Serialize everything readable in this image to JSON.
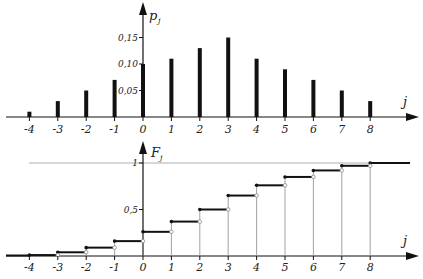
{
  "chart_data": [
    {
      "type": "bar",
      "title": "",
      "ylabel": "p_j",
      "xlabel": "j",
      "categories": [
        -4,
        -3,
        -2,
        -1,
        0,
        1,
        2,
        3,
        4,
        5,
        6,
        7,
        8
      ],
      "values": [
        0.01,
        0.03,
        0.05,
        0.07,
        0.1,
        0.11,
        0.13,
        0.15,
        0.11,
        0.09,
        0.07,
        0.05,
        0.03
      ],
      "yticks": [
        0.05,
        0.1,
        0.15
      ],
      "ytick_labels": [
        "0,05",
        "0,10",
        "0,15"
      ],
      "ylim": [
        0,
        0.2
      ],
      "grid": false
    },
    {
      "type": "line",
      "subtype": "step",
      "title": "",
      "ylabel": "F_j",
      "xlabel": "j",
      "x": [
        -4,
        -3,
        -2,
        -1,
        0,
        1,
        2,
        3,
        4,
        5,
        6,
        7,
        8
      ],
      "values": [
        0.01,
        0.04,
        0.09,
        0.16,
        0.26,
        0.37,
        0.5,
        0.65,
        0.76,
        0.85,
        0.92,
        0.97,
        1.0
      ],
      "yticks": [
        0.5,
        1
      ],
      "ytick_labels": [
        "0,5",
        "1"
      ],
      "reference_line": 1,
      "ylim": [
        0,
        1.2
      ],
      "grid": false
    }
  ],
  "top_panel": {
    "y_axis_label": "p",
    "y_axis_sub": "j",
    "x_axis_label": "j"
  },
  "bottom_panel": {
    "y_axis_label": "F",
    "y_axis_sub": "j",
    "x_axis_label": "j"
  },
  "colors": {
    "ink": "#111111",
    "guide": "#8a8a8a",
    "reference": "#9a9a9a"
  }
}
